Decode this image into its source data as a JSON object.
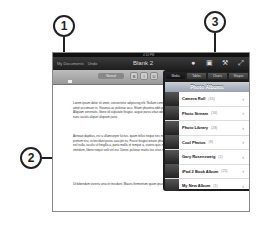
{
  "callouts": [
    {
      "number": "1"
    },
    {
      "number": "2"
    },
    {
      "number": "3"
    }
  ],
  "statusbar": {
    "carrier": "iPad",
    "time": "4:10 PM",
    "battery": "100%"
  },
  "toolbar": {
    "left_buttons": [
      "My Documents",
      "Undo"
    ],
    "title": "Blank 2",
    "icons": [
      "info-icon",
      "media-icon",
      "tools-icon",
      "fullscreen-icon"
    ]
  },
  "formatbar": {
    "style_label": "Normal",
    "buttons": [
      "B",
      "I",
      "U"
    ]
  },
  "document": {
    "paragraphs": [
      "Lorem ipsum dolor sit amet, consectetur adipiscing elit. Nullam commodo ac elementum in. Suspendisse dictum eu amet accumsan in. Vivamus ac pulvinar arcu. Etiam pharetra nibh porttitor. Cras sagittis placerat libero. Quisque sed. Aliquam venenatis, libero id vulputate feugiat, augue purus vitae odio. Morbi hendrerit dictum felis. Integer in odio et nunc iaculis aliquet aliquam justo.",
      "Aenean dapibus, est a ullamcorper luctus, quam tellus neque nec metus. Etiam diam urna, iaculis non pretium dictum pretium nisi, ut tincidunt purus suscipit eu. Fusce feugiat ornare pharetra. Donec sed hendrerit erat auctor. Pellentesque nisl nulla, iaculis ut fringilla a, porta mollis et tempor a, viverra quis mauris. Nam ultricies. Nam euismod, nulla ac luctus interdum, libero neque velit vel est. Donec pulvinar mattis leo vitae mauris arcu.",
      "Ut bibendum viverra urna et tincidunt. Mauris fermentum quam ipsum, rutrum non fringilla ullamcorper."
    ]
  },
  "popover": {
    "tabs": [
      "Media",
      "Tables",
      "Charts",
      "Shapes"
    ],
    "active_tab": "Media",
    "header": "Photo Albums",
    "albums": [
      {
        "name": "Camera Roll",
        "count": "(10)"
      },
      {
        "name": "Photo Stream",
        "count": "(16)"
      },
      {
        "name": "Photo Library",
        "count": "(28)"
      },
      {
        "name": "Cool Photos",
        "count": "(8)"
      },
      {
        "name": "Gary Rosenzweig",
        "count": "(1)"
      },
      {
        "name": "iPad 2 Book Album",
        "count": "(25)"
      },
      {
        "name": "My New Album",
        "count": "(1)"
      }
    ]
  }
}
